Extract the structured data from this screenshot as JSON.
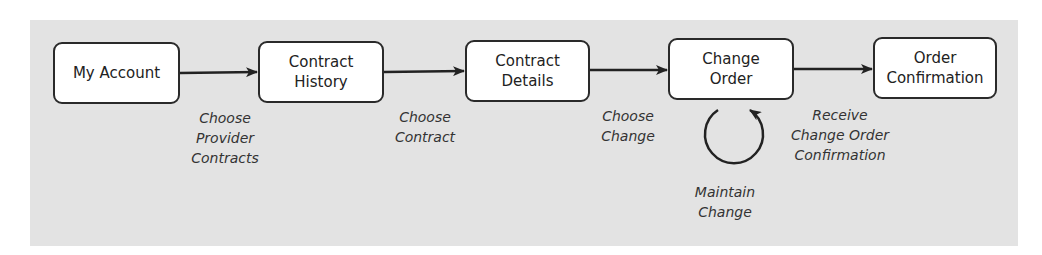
{
  "diagram": {
    "type": "flowchart",
    "nodes": [
      {
        "id": "my-account",
        "label": "My Account"
      },
      {
        "id": "contract-history",
        "label": "Contract\nHistory"
      },
      {
        "id": "contract-details",
        "label": "Contract\nDetails"
      },
      {
        "id": "change-order",
        "label": "Change\nOrder"
      },
      {
        "id": "order-confirmation",
        "label": "Order\nConfirmation"
      }
    ],
    "edges": [
      {
        "from": "my-account",
        "to": "contract-history",
        "label": "Choose\nProvider\nContracts"
      },
      {
        "from": "contract-history",
        "to": "contract-details",
        "label": "Choose\nContract"
      },
      {
        "from": "contract-details",
        "to": "change-order",
        "label": "Choose\nChange"
      },
      {
        "from": "change-order",
        "to": "order-confirmation",
        "label": "Receive\nChange Order\nConfirmation"
      },
      {
        "from": "change-order",
        "to": "change-order",
        "label": "Maintain\nChange",
        "kind": "self-loop"
      }
    ],
    "colors": {
      "background": "#e3e3e3",
      "node_fill": "#ffffff",
      "stroke": "#2a2a2a",
      "text": "#222222"
    }
  }
}
